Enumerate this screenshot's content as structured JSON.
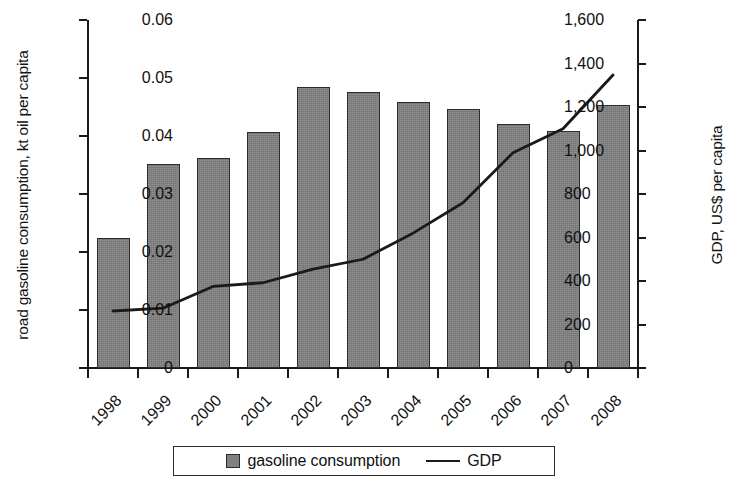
{
  "chart_data": {
    "type": "bar",
    "title": "",
    "subtitle": "",
    "categories": [
      "1998",
      "1999",
      "2000",
      "2001",
      "2002",
      "2003",
      "2004",
      "2005",
      "2006",
      "2007",
      "2008"
    ],
    "xlabel": "",
    "grid": false,
    "legend_position": "bottom",
    "series": [
      {
        "name": "gasoline consumption",
        "type": "bar",
        "axis": "left",
        "color": "#818181",
        "values": [
          0.0224,
          0.0352,
          0.0362,
          0.0407,
          0.0485,
          0.0476,
          0.0458,
          0.0447,
          0.042,
          0.0409,
          0.0453
        ]
      },
      {
        "name": "GDP",
        "type": "line",
        "axis": "right",
        "color": "#1a1a1a",
        "values": [
          262,
          275,
          375,
          392,
          455,
          500,
          620,
          760,
          990,
          1100,
          1347
        ]
      }
    ],
    "y_left": {
      "label": "road gasoline consumption, kt oil per capita",
      "min": 0,
      "max": 0.06,
      "ticks": [
        0,
        0.01,
        0.02,
        0.03,
        0.04,
        0.05,
        0.06
      ],
      "tick_labels": [
        "0",
        "0.01",
        "0.02",
        "0.03",
        "0.04",
        "0.05",
        "0.06"
      ]
    },
    "y_right": {
      "label": "GDP, US$ per capita",
      "min": 0,
      "max": 1600,
      "ticks": [
        0,
        200,
        400,
        600,
        800,
        1000,
        1200,
        1400,
        1600
      ],
      "tick_labels": [
        "0",
        "200",
        "400",
        "600",
        "800",
        "1,000",
        "1,200",
        "1,400",
        "1,600"
      ]
    },
    "legend": [
      {
        "label": "gasoline consumption",
        "marker": "square"
      },
      {
        "label": "GDP",
        "marker": "line"
      }
    ]
  }
}
